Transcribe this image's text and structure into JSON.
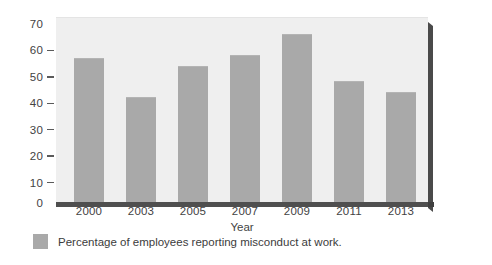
{
  "chart_data": {
    "type": "bar",
    "title": "",
    "xlabel": "Year",
    "ylabel": "",
    "categories": [
      "2000",
      "2003",
      "2005",
      "2007",
      "2009",
      "2011",
      "2013"
    ],
    "values": [
      55,
      40,
      52,
      56,
      64,
      46,
      42
    ],
    "ylim": [
      0,
      70
    ],
    "ytick_values": [
      70,
      60,
      50,
      40,
      30,
      20,
      10,
      0
    ],
    "ytick_labels": [
      "70",
      "60",
      "50",
      "40",
      "30",
      "20",
      "10",
      "0"
    ],
    "grid": false,
    "legend_position": "bottom-left",
    "legend": [
      {
        "label": "Percentage of employees reporting misconduct at work.",
        "color": "#a9a9a9"
      }
    ],
    "series": [
      {
        "name": "Percentage of employees reporting misconduct at work.",
        "color": "#a9a9a9",
        "values": [
          55,
          40,
          52,
          56,
          64,
          46,
          42
        ]
      }
    ]
  },
  "colors": {
    "bar": "#a9a9a9",
    "plot_background": "#efefef",
    "axis": "#4f4f4f",
    "text": "#434343",
    "page_background": "#ffffff"
  }
}
